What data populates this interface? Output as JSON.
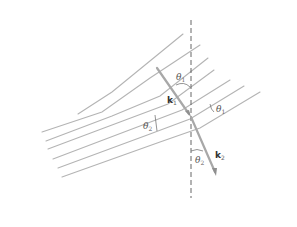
{
  "diagram": {
    "labels": {
      "theta1_incident": "θ",
      "theta1_incident_sub": "1",
      "theta1_wavefront": "θ",
      "theta1_wavefront_sub": "1",
      "theta2_wavefront": "θ",
      "theta2_wavefront_sub": "2",
      "theta2_refracted": "θ",
      "theta2_refracted_sub": "2",
      "k1": "k",
      "k1_sub": "1",
      "k2": "k",
      "k2_sub": "2"
    },
    "colors": {
      "wavefront": "#b4b4b4",
      "normal_line": "#555555",
      "wave_vector": "#a8a8a8",
      "label": "#555555"
    },
    "elements": {
      "normal": "vertical dashed normal line through interface point",
      "incident_wavefronts": 6,
      "refracted_wavefronts": 6
    }
  }
}
